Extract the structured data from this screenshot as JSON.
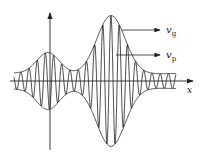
{
  "diagram": {
    "axis_x_label": "x",
    "labels": {
      "group_velocity": {
        "symbol": "v",
        "subscript": "g"
      },
      "phase_velocity": {
        "symbol": "v",
        "subscript": "p"
      }
    },
    "colors": {
      "stroke": "#222222",
      "background": "#ffffff"
    }
  }
}
